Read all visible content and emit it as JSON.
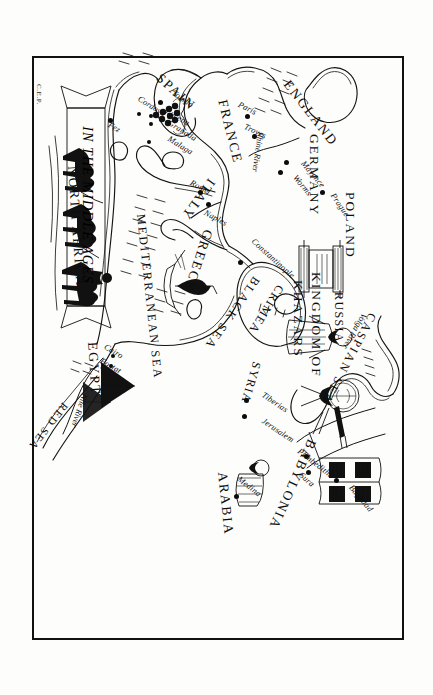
{
  "map": {
    "title": "IN THE MIDDLE AGES",
    "signature": "C.E.P.",
    "orientation_note": "rotated",
    "seas": [
      {
        "name": "CASPIAN SEA",
        "id": "caspian-sea"
      },
      {
        "name": "BLACK SEA",
        "id": "black-sea"
      },
      {
        "name": "MEDITERRANEAN SEA",
        "id": "mediterranean-sea"
      },
      {
        "name": "RED SEA",
        "id": "red-sea"
      }
    ],
    "regions": [
      {
        "name": "RUSSIA",
        "id": "russia"
      },
      {
        "name": "KINGDOM OF",
        "id": "kingdom-of-khazars-line1"
      },
      {
        "name": "KHAZARS",
        "id": "kingdom-of-khazars-line2"
      },
      {
        "name": "CRIMEA",
        "id": "crimea"
      },
      {
        "name": "POLAND",
        "id": "poland"
      },
      {
        "name": "GERMANY",
        "id": "germany"
      },
      {
        "name": "ENGLAND",
        "id": "england"
      },
      {
        "name": "FRANCE",
        "id": "france"
      },
      {
        "name": "SPAIN",
        "id": "spain"
      },
      {
        "name": "ITALY",
        "id": "italy"
      },
      {
        "name": "GREECE",
        "id": "greece"
      },
      {
        "name": "SYRIA",
        "id": "syria"
      },
      {
        "name": "BABYLONIA",
        "id": "babylonia"
      },
      {
        "name": "ARABIA",
        "id": "arabia"
      },
      {
        "name": "EGYPT",
        "id": "egypt"
      },
      {
        "name": "NORTH AFRICA",
        "id": "north-africa"
      }
    ],
    "rivers": [
      {
        "name": "Volga River",
        "id": "volga-river"
      },
      {
        "name": "Rhine River",
        "id": "rhine-river"
      },
      {
        "name": "Nile River",
        "id": "nile-river"
      }
    ],
    "cities": [
      {
        "name": "Constantinople",
        "id": "constantinople"
      },
      {
        "name": "Prague",
        "id": "prague"
      },
      {
        "name": "Mayence",
        "id": "mayence"
      },
      {
        "name": "Worms",
        "id": "worms"
      },
      {
        "name": "Paris",
        "id": "paris"
      },
      {
        "name": "Troyes",
        "id": "troyes"
      },
      {
        "name": "Toledo",
        "id": "toledo"
      },
      {
        "name": "Lucena",
        "id": "lucena"
      },
      {
        "name": "Granada",
        "id": "granada"
      },
      {
        "name": "Cordova",
        "id": "cordova"
      },
      {
        "name": "Malaga",
        "id": "malaga"
      },
      {
        "name": "Fez",
        "id": "fez"
      },
      {
        "name": "Rome",
        "id": "rome"
      },
      {
        "name": "Naples",
        "id": "naples"
      },
      {
        "name": "Baghdad",
        "id": "baghdad"
      },
      {
        "name": "Sura",
        "id": "sura"
      },
      {
        "name": "Pumbeditha",
        "id": "pumbeditha"
      },
      {
        "name": "Jerusalem",
        "id": "jerusalem"
      },
      {
        "name": "Tiberias",
        "id": "tiberias"
      },
      {
        "name": "Medina",
        "id": "medina"
      },
      {
        "name": "Cairo",
        "id": "cairo"
      },
      {
        "name": "Fostat",
        "id": "fostat"
      }
    ],
    "illustrations": [
      {
        "name": "khazar-king-figure",
        "id": "khazar-king"
      },
      {
        "name": "open-talmud-book",
        "id": "talmud-book"
      },
      {
        "name": "polish-rabbi-figure",
        "id": "polish-rabbi"
      },
      {
        "name": "torah-scroll",
        "id": "torah-scroll"
      },
      {
        "name": "sailing-ship",
        "id": "sailing-ship"
      },
      {
        "name": "pyramids",
        "id": "pyramids"
      },
      {
        "name": "standing-figure-arabia",
        "id": "arabia-figure"
      },
      {
        "name": "camel-caravan",
        "id": "camel-caravan"
      },
      {
        "name": "grape-vine",
        "id": "grape-vine"
      }
    ],
    "colors": {
      "ink": "#111111",
      "paper": "#fdfdfb"
    }
  }
}
